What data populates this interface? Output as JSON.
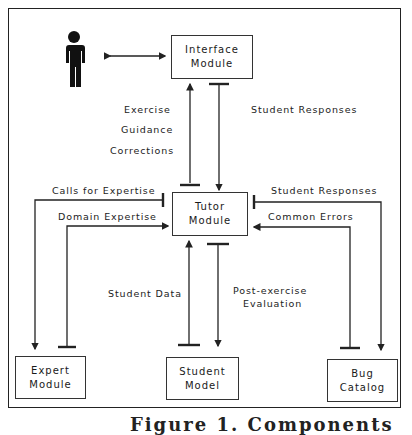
{
  "diagram": {
    "nodes": {
      "user": {
        "label": "User (person figure)"
      },
      "interface": {
        "line1": "Interface",
        "line2": "Module"
      },
      "tutor": {
        "line1": "Tutor",
        "line2": "Module"
      },
      "expert": {
        "line1": "Expert",
        "line2": "Module"
      },
      "student": {
        "line1": "Student",
        "line2": "Model"
      },
      "bug": {
        "line1": "Bug",
        "line2": "Catalog"
      }
    },
    "edges": {
      "exercise": "Exercise",
      "guidance": "Guidance",
      "corrections": "Corrections",
      "student_responses_top": "Student Responses",
      "calls_for_expertise": "Calls for Expertise",
      "domain_expertise": "Domain Expertise",
      "student_responses_right": "Student Responses",
      "common_errors": "Common Errors",
      "student_data": "Student Data",
      "post_exercise_1": "Post-exercise",
      "post_exercise_2": "Evaluation"
    },
    "caption": "Figure 1. Components"
  }
}
